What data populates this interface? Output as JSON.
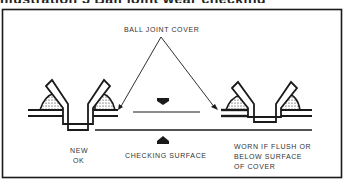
{
  "heading": {
    "text": "Illustration 5 Ball joint wear checking"
  },
  "diagram": {
    "labels": {
      "ball_joint_cover": "BALL JOINT COVER",
      "new_ok_line1": "NEW",
      "new_ok_line2": "OK",
      "checking_surface": "CHECKING SURFACE",
      "worn_line1": "WORN IF FLUSH OR",
      "worn_line2": "BELOW SURFACE",
      "worn_line3": "OF COVER"
    },
    "colors": {
      "ink": "#1a1a1a",
      "paper": "#ffffff"
    }
  }
}
